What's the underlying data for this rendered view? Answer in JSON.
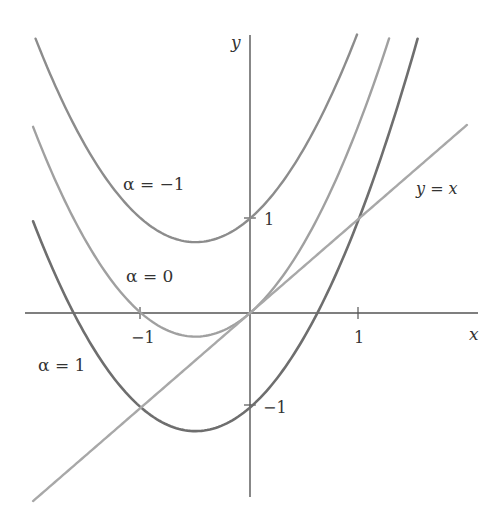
{
  "chart_data": {
    "type": "line",
    "title": "",
    "xlabel": "x",
    "ylabel": "y",
    "xlim": [
      -2.07,
      2.09
    ],
    "ylim": [
      -1.93,
      2.93
    ],
    "grid": false,
    "legend": "inline labels",
    "x_ticks": [
      {
        "value": -1,
        "label": "−1"
      },
      {
        "value": 1,
        "label": "1"
      }
    ],
    "y_ticks": [
      {
        "value": 1,
        "label": "1"
      },
      {
        "value": -1,
        "label": "−1"
      }
    ],
    "formula": "y = x^2 + x - α",
    "series": [
      {
        "name": "α = −1",
        "alpha": -1,
        "color": "#8c8c8c",
        "width": 2.4,
        "x_range": [
          -1.99,
          1.64
        ],
        "label_pos": [
          -0.98,
          1.4
        ],
        "sample": [
          [
            -2,
            3
          ],
          [
            -1,
            1
          ],
          [
            -0.5,
            0.75
          ],
          [
            0,
            1
          ],
          [
            1,
            3
          ]
        ]
      },
      {
        "name": "α = 0",
        "alpha": 0,
        "color": "#a0a0a0",
        "width": 2.4,
        "x_range": [
          -1.99,
          1.91
        ],
        "label_pos": [
          -1.0,
          0.4
        ],
        "sample": [
          [
            -2,
            2
          ],
          [
            -1,
            0
          ],
          [
            -0.5,
            -0.25
          ],
          [
            0,
            0
          ],
          [
            1,
            2
          ]
        ]
      },
      {
        "name": "α = 1",
        "alpha": 1,
        "color": "#6e6e6e",
        "width": 2.6,
        "x_range": [
          -1.99,
          2.13
        ],
        "label_pos": [
          -1.97,
          -0.65
        ],
        "sample": [
          [
            -2,
            1
          ],
          [
            -1,
            -1
          ],
          [
            -0.5,
            -1.25
          ],
          [
            0,
            -1
          ],
          [
            1,
            1
          ]
        ]
      },
      {
        "name": "y = x",
        "color": "#a8a8a8",
        "width": 2.4,
        "x_range": [
          -1.99,
          1.99
        ],
        "label_pos": [
          1.55,
          1.35
        ],
        "sample": [
          [
            -2,
            -2
          ],
          [
            0,
            0
          ],
          [
            2,
            2
          ]
        ]
      }
    ]
  },
  "labels": {
    "x_axis": "x",
    "y_axis": "y",
    "alpha_neg1": "α = −1",
    "alpha_0": "α = 0",
    "alpha_1": "α = 1",
    "identity": "y = x",
    "tick_x_neg1": "−1",
    "tick_x_1": "1",
    "tick_y_1": "1",
    "tick_y_neg1": "−1"
  },
  "layout": {
    "origin_px": [
      250,
      313
    ],
    "unit_x_px": 109,
    "unit_y_px": 94.5,
    "axis_color": "#555555"
  }
}
